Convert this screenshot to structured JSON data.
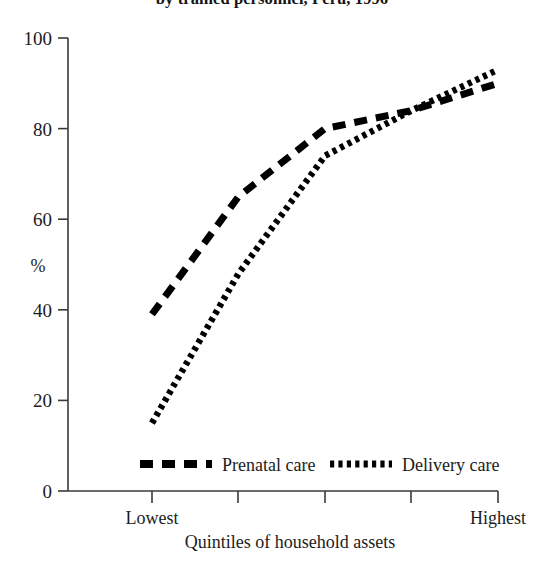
{
  "chart_data": {
    "type": "line",
    "title": "by trained personnel, Peru, 1996",
    "xlabel": "Quintiles of household assets",
    "ylabel": "%",
    "categories": [
      "Lowest",
      "2",
      "3",
      "4",
      "Highest"
    ],
    "tick_labels_x": [
      "Lowest",
      "",
      "",
      "",
      "Highest"
    ],
    "x_first_label": "Lowest",
    "x_last_label": "Highest",
    "ylim": [
      0,
      100
    ],
    "yticks": [
      0,
      20,
      40,
      60,
      80,
      100
    ],
    "ytick_labels": [
      "0",
      "20",
      "40",
      "60",
      "80",
      "100"
    ],
    "grid": false,
    "legend_position": "bottom-center",
    "series": [
      {
        "name": "Prenatal care",
        "style": "dashed",
        "values": [
          39,
          65,
          80,
          84,
          90
        ]
      },
      {
        "name": "Delivery care",
        "style": "dotted",
        "values": [
          15,
          48,
          74,
          84,
          93
        ]
      }
    ]
  }
}
